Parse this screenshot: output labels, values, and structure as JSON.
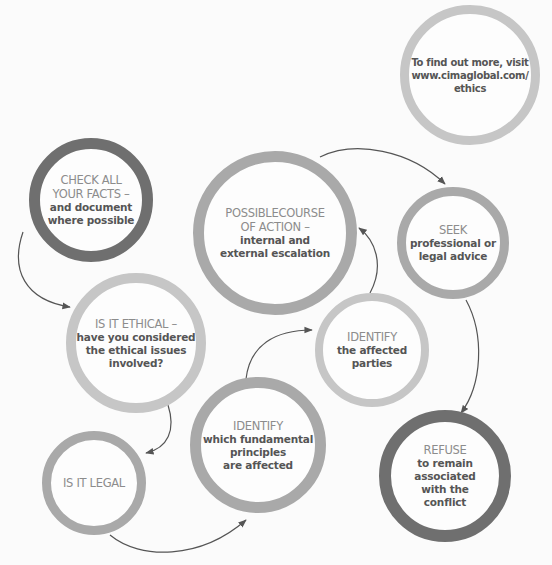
{
  "diagram": {
    "colors": {
      "background": "#fbfbfb",
      "ring_light": "#c6c6c6",
      "ring_mid": "#a9a9a9",
      "ring_dark": "#6f6f6f",
      "heading_text": "#8c8c8c",
      "body_text": "#555555",
      "arrow": "#555555"
    },
    "nodes": [
      {
        "id": "more-info",
        "heading": [],
        "body": [
          "To find out more, visit",
          "www.cimaglobal.com/",
          "ethics"
        ],
        "center": [
          470,
          75
        ],
        "radius": 70,
        "ring": "light"
      },
      {
        "id": "check-facts",
        "heading": [
          "CHECK ALL",
          "YOUR FACTS –"
        ],
        "body": [
          "and document",
          "where possible"
        ],
        "center": [
          91,
          200
        ],
        "radius": 62,
        "ring": "dark"
      },
      {
        "id": "possible-course",
        "heading": [
          "POSSIBLECOURSE",
          "OF ACTION –"
        ],
        "body": [
          "internal and",
          "external escalation"
        ],
        "center": [
          275,
          233
        ],
        "radius": 82,
        "ring": "mid"
      },
      {
        "id": "seek-advice",
        "heading": [
          "SEEK"
        ],
        "body": [
          "professional or",
          "legal advice"
        ],
        "center": [
          453,
          243
        ],
        "radius": 56,
        "ring": "mid"
      },
      {
        "id": "is-it-ethical",
        "heading": [
          "IS IT ETHICAL –"
        ],
        "body": [
          "have you considered",
          "the ethical issues",
          "involved?"
        ],
        "center": [
          136,
          343
        ],
        "radius": 70,
        "ring": "light"
      },
      {
        "id": "identify-parties",
        "heading": [
          "IDENTIFY"
        ],
        "body": [
          "the affected",
          "parties"
        ],
        "center": [
          372,
          350
        ],
        "radius": 57,
        "ring": "light"
      },
      {
        "id": "identify-principles",
        "heading": [
          "IDENTIFY"
        ],
        "body": [
          "which fundamental",
          "principles",
          "are affected"
        ],
        "center": [
          258,
          445
        ],
        "radius": 68,
        "ring": "mid"
      },
      {
        "id": "is-it-legal",
        "heading": [
          "IS IT LEGAL"
        ],
        "body": [],
        "center": [
          94,
          483
        ],
        "radius": 52,
        "ring": "mid"
      },
      {
        "id": "refuse",
        "heading": [
          "REFUSE"
        ],
        "body": [
          "to remain",
          "associated",
          "with the",
          "conflict"
        ],
        "center": [
          445,
          476
        ],
        "radius": 66,
        "ring": "dark"
      }
    ],
    "edges": [
      {
        "from": "check-facts",
        "to": "is-it-ethical"
      },
      {
        "from": "is-it-ethical",
        "to": "is-it-legal"
      },
      {
        "from": "is-it-legal",
        "to": "identify-principles"
      },
      {
        "from": "identify-principles",
        "to": "identify-parties"
      },
      {
        "from": "identify-parties",
        "to": "possible-course"
      },
      {
        "from": "possible-course",
        "to": "seek-advice"
      },
      {
        "from": "seek-advice",
        "to": "refuse"
      }
    ]
  }
}
